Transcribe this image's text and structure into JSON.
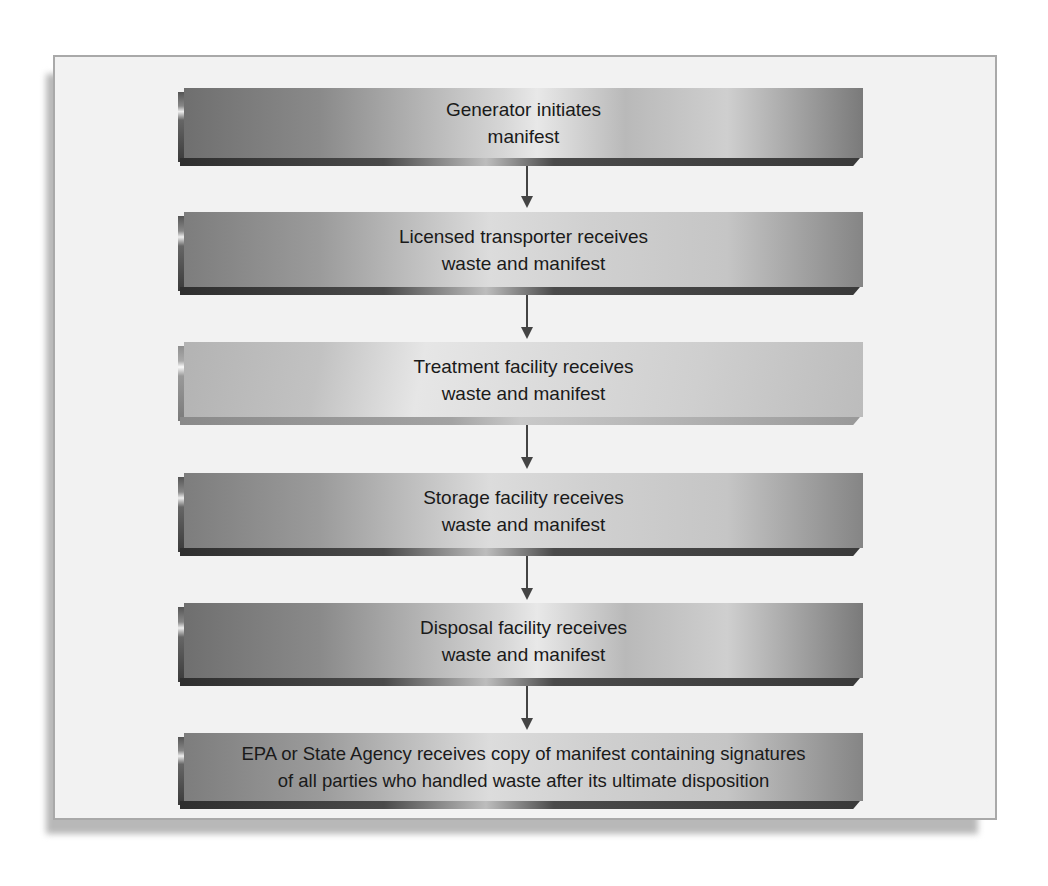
{
  "diagram": {
    "type": "vertical-flowchart",
    "steps": [
      {
        "line1": "Generator initiates",
        "line2": "manifest"
      },
      {
        "line1": "Licensed transporter receives",
        "line2": "waste and manifest"
      },
      {
        "line1": "Treatment facility receives",
        "line2": "waste and manifest"
      },
      {
        "line1": "Storage facility receives",
        "line2": "waste and manifest"
      },
      {
        "line1": "Disposal facility receives",
        "line2": "waste and manifest"
      },
      {
        "line1": "EPA or State Agency receives copy of manifest containing signatures",
        "line2": "of all parties who handled waste after its ultimate disposition"
      }
    ],
    "connectors": [
      {
        "from": 0,
        "to": 1,
        "icon": "arrow-down-icon"
      },
      {
        "from": 1,
        "to": 2,
        "icon": "arrow-down-icon"
      },
      {
        "from": 2,
        "to": 3,
        "icon": "arrow-down-icon"
      },
      {
        "from": 3,
        "to": 4,
        "icon": "arrow-down-icon"
      },
      {
        "from": 4,
        "to": 5,
        "icon": "arrow-down-icon"
      }
    ],
    "colors": {
      "frame_background": "#f2f2f2",
      "frame_border": "#a9a9a9",
      "box_dark": "#6f6f6f",
      "box_light": "#e8e8e8",
      "arrow": "#444444",
      "text": "#1a1a1a"
    }
  }
}
